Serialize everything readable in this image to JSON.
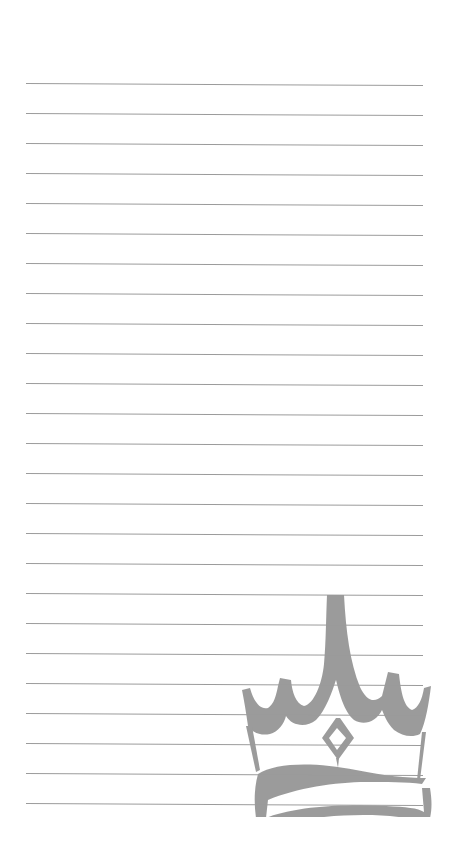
{
  "page": {
    "type": "lined-notepaper",
    "background_color": "#ffffff"
  },
  "rules": {
    "count": 25,
    "first_y": 83,
    "spacing": 30,
    "left_x": 26,
    "right_x": 423,
    "color": "#9b9b9b"
  },
  "watermark": {
    "icon": "crown-icon",
    "color": "#9a9a9a"
  }
}
